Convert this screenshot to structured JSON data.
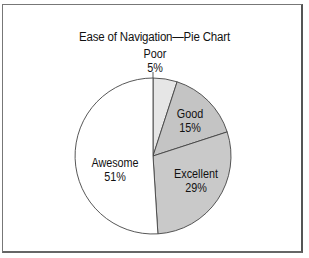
{
  "chart_data": {
    "type": "pie",
    "title": "Ease of Navigation—Pie Chart",
    "categories": [
      "Poor",
      "Good",
      "Excellent",
      "Awesome"
    ],
    "values": [
      5,
      15,
      29,
      51
    ],
    "unit": "%",
    "labels": [
      {
        "name": "Poor",
        "value": "5%"
      },
      {
        "name": "Good",
        "value": "15%"
      },
      {
        "name": "Excellent",
        "value": "29%"
      },
      {
        "name": "Awesome",
        "value": "51%"
      }
    ],
    "colors": [
      "#e6e6e6",
      "#c4c4c4",
      "#c9c9c9",
      "#ffffff"
    ],
    "start_angle_deg": 0,
    "direction": "clockwise",
    "legend": "none (labels placed on/near slices)"
  }
}
